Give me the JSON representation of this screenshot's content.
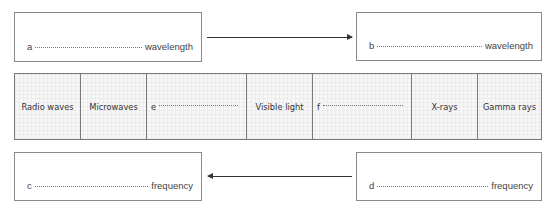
{
  "boxes": {
    "top_left": {
      "letter": "a",
      "label": "wavelength"
    },
    "top_right": {
      "letter": "b",
      "label": "wavelength"
    },
    "bottom_left": {
      "letter": "c",
      "label": "frequency"
    },
    "bottom_right": {
      "letter": "d",
      "label": "frequency"
    }
  },
  "arrows": {
    "top": {
      "direction": "right"
    },
    "bottom": {
      "direction": "left"
    }
  },
  "spectrum": {
    "cells": [
      {
        "label": "Radio waves"
      },
      {
        "label": "Microwaves"
      },
      {
        "label": "e",
        "blank": true
      },
      {
        "label": "Visible light"
      },
      {
        "label": "f",
        "blank": true
      },
      {
        "label": "X-rays"
      },
      {
        "label": "Gamma rays"
      }
    ]
  }
}
